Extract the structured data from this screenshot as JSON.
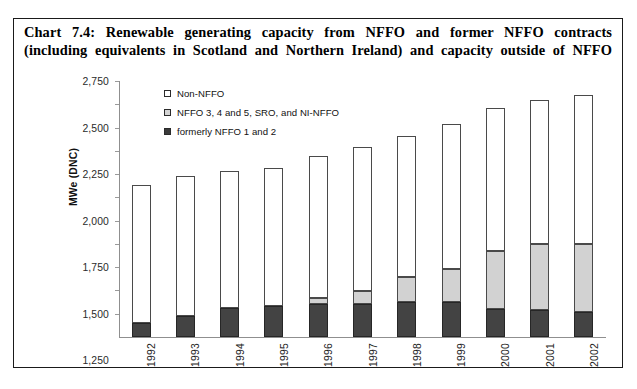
{
  "chart_data": {
    "type": "bar",
    "subtype": "stacked",
    "title": "Chart 7.4: Renewable generating capacity from NFFO and former NFFO contracts (including equivalents in Scotland and Northern Ireland) and capacity outside of NFFO",
    "title_line1": "Chart 7.4: Renewable generating capacity from NFFO and former NFFO contracts",
    "title_line2": "(including equivalents in Scotland and Northern Ireland) and capacity outside of NFFO",
    "xlabel": "",
    "ylabel": "MWe (DNC)",
    "ylim": [
      0,
      2750
    ],
    "ytick_step": 250,
    "grid": false,
    "legend_position": "inside-top-left",
    "categories": [
      "1992",
      "1993",
      "1994",
      "1995",
      "1996",
      "1997",
      "1998",
      "1999",
      "2000",
      "2001",
      "2002"
    ],
    "ytick_labels": [
      "2,750",
      "2,500",
      "2,250",
      "2,000",
      "1,750",
      "1,500",
      "1,250",
      "1,000",
      "750",
      "500",
      "250"
    ],
    "ytick_values": [
      2750,
      2500,
      2250,
      2000,
      1750,
      1500,
      1250,
      1000,
      750,
      500,
      250
    ],
    "series": [
      {
        "name": "formerly NFFO 1 and 2",
        "color": "#434343",
        "stack_order": 1,
        "values": [
          150,
          230,
          310,
          330,
          350,
          360,
          375,
          375,
          300,
          290,
          265
        ]
      },
      {
        "name": "NFFO 3, 4 and 5, SRO, and NI-NFFO",
        "color": "#d2d2d2",
        "stack_order": 2,
        "values": [
          0,
          0,
          0,
          0,
          70,
          130,
          265,
          355,
          620,
          705,
          735
        ]
      },
      {
        "name": "Non-NFFO",
        "color": "#ffffff",
        "stack_order": 3,
        "values": [
          1480,
          1500,
          1470,
          1490,
          1520,
          1550,
          1520,
          1560,
          1540,
          1550,
          1605
        ]
      }
    ],
    "totals": [
      1630,
      1730,
      1780,
      1820,
      1940,
      2040,
      2160,
      2290,
      2460,
      2545,
      2605
    ]
  },
  "legend": {
    "items": [
      {
        "label": "Non-NFFO",
        "swatch": "white"
      },
      {
        "label": "NFFO 3, 4 and 5, SRO, and NI-NFFO",
        "swatch": "gray"
      },
      {
        "label": "formerly NFFO 1 and 2",
        "swatch": "dark"
      }
    ]
  }
}
